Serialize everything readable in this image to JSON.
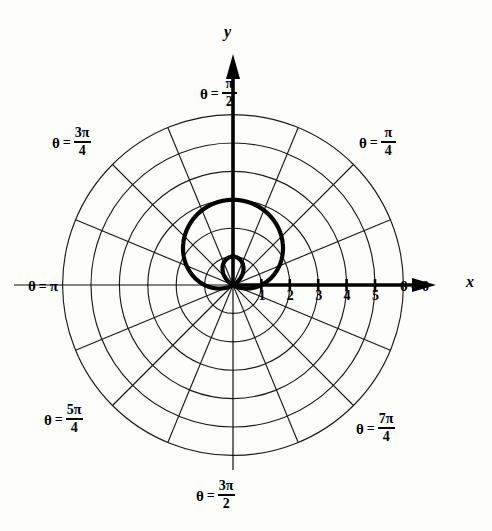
{
  "figure": {
    "kind": "polar-grid-plot",
    "background_color": "#fdfdfc",
    "ink_color": "#000000",
    "grid_color": "#1a1a1a"
  },
  "axes": {
    "x_axis_label": "x",
    "y_axis_label": "y",
    "x_tick_labels": [
      "1",
      "2",
      "3",
      "4",
      "5"
    ],
    "x_tick_values": [
      1,
      2,
      3,
      4,
      5
    ]
  },
  "angle_labels": [
    {
      "id": "theta-0",
      "theta_symbol": "θ",
      "equals": "=",
      "value": "0",
      "kind": "plain",
      "numerator": "",
      "denominator": ""
    },
    {
      "id": "theta-pi-4",
      "theta_symbol": "θ",
      "equals": "=",
      "value": "",
      "kind": "fraction",
      "numerator": "π",
      "denominator": "4"
    },
    {
      "id": "theta-pi-2",
      "theta_symbol": "θ",
      "equals": "=",
      "value": "",
      "kind": "fraction",
      "numerator": "π",
      "denominator": "2"
    },
    {
      "id": "theta-3pi-4",
      "theta_symbol": "θ",
      "equals": "=",
      "value": "",
      "kind": "fraction",
      "numerator": "3π",
      "denominator": "4"
    },
    {
      "id": "theta-pi",
      "theta_symbol": "θ",
      "equals": "=",
      "value": "π",
      "kind": "plain",
      "numerator": "",
      "denominator": ""
    },
    {
      "id": "theta-5pi-4",
      "theta_symbol": "θ",
      "equals": "=",
      "value": "",
      "kind": "fraction",
      "numerator": "5π",
      "denominator": "4"
    },
    {
      "id": "theta-3pi-2",
      "theta_symbol": "θ",
      "equals": "=",
      "value": "",
      "kind": "fraction",
      "numerator": "3π",
      "denominator": "2"
    },
    {
      "id": "theta-7pi-4",
      "theta_symbol": "θ",
      "equals": "=",
      "value": "",
      "kind": "fraction",
      "numerator": "7π",
      "denominator": "4"
    }
  ],
  "chart_data": {
    "type": "line",
    "coordinate_system": "polar",
    "title": "",
    "xlabel": "x",
    "ylabel": "y",
    "grid": true,
    "legend": "none",
    "polar_grid": {
      "radial_circles": [
        1,
        2,
        3,
        4,
        5,
        6
      ],
      "radial_tick_labels": [
        "1",
        "2",
        "3",
        "4",
        "5"
      ],
      "spoke_count": 16,
      "spoke_step_radians": "pi/8",
      "angle_tick_labels": [
        "0",
        "pi/4",
        "pi/2",
        "3pi/4",
        "pi",
        "5pi/4",
        "3pi/2",
        "7pi/4"
      ],
      "rlim": [
        0,
        6
      ],
      "pole_at_image": [
        233,
        285
      ],
      "pixels_per_unit": 28.4
    },
    "series": [
      {
        "name": "limacon",
        "equation": "r = 1 + 2 sin(theta)",
        "a": 1,
        "b": 2,
        "r_max": 3,
        "r_at_theta_0": 1,
        "r_at_theta_pi_2": 3,
        "r_at_theta_pi": 1,
        "r_at_theta_3pi_2": -1,
        "inner_loop": true,
        "inner_loop_extent": 1,
        "symmetry_axis": "y-axis",
        "theta": [
          0,
          0.3927,
          0.7854,
          1.1781,
          1.5708,
          1.9635,
          2.3562,
          2.7489,
          3.1416,
          3.5343,
          3.927,
          4.3197,
          4.7124,
          5.1051,
          5.4978,
          5.8905,
          6.2832
        ],
        "r": [
          1.0,
          1.7654,
          2.4142,
          2.8478,
          3.0,
          2.8478,
          2.4142,
          1.7654,
          1.0,
          0.2346,
          -0.4142,
          -0.8478,
          -1.0,
          -0.8478,
          -0.4142,
          0.2346,
          1.0
        ]
      }
    ]
  }
}
